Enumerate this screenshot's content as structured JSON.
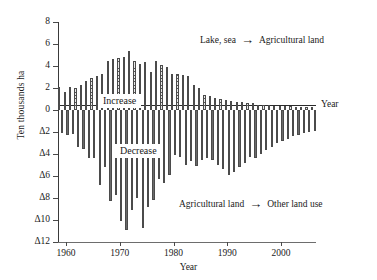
{
  "chart_data": {
    "type": "bar",
    "title": "",
    "xlabel": "Year",
    "ylabel": "Ten thousands  ha",
    "ylim": [
      -12,
      8
    ],
    "xlim": [
      1958.5,
      2006.5
    ],
    "grid": false,
    "legend_position": "none",
    "ytick_labels": [
      "8",
      "6",
      "4",
      "2",
      "0",
      "Δ2",
      "Δ4",
      "Δ6",
      "Δ8",
      "Δ10",
      "Δ12"
    ],
    "ytick_values": [
      8,
      6,
      4,
      2,
      0,
      -2,
      -4,
      -6,
      -8,
      -10,
      -12
    ],
    "xtick_labels": [
      "1960",
      "1970",
      "1980",
      "1990",
      "2000"
    ],
    "xtick_values": [
      1960,
      1970,
      1980,
      1990,
      2000
    ],
    "axis_right_label": "Year",
    "series": [
      {
        "name": "Lake, sea → Agricultural land",
        "direction": "increase",
        "pattern": "diagonal-crosshatch",
        "values": [
          2.1,
          1.6,
          2.1,
          2.0,
          2.3,
          2.6,
          2.9,
          3.1,
          3.3,
          4.5,
          4.6,
          4.7,
          4.8,
          5.4,
          4.5,
          4.2,
          4.4,
          3.5,
          4.5,
          4.1,
          3.9,
          3.3,
          3.3,
          3.2,
          3.1,
          2.3,
          2.0,
          1.4,
          1.3,
          1.1,
          1.0,
          0.9,
          0.8,
          0.7,
          0.7,
          0.6,
          0.6,
          0.5,
          0.5,
          0.5,
          0.4,
          0.4,
          0.4,
          0.4,
          0.3,
          0.3,
          0.3,
          0.3
        ]
      },
      {
        "name": "Agricultural land → Other land use",
        "direction": "decrease",
        "pattern": "vertical-lines",
        "values": [
          -2.1,
          -2.3,
          -2.2,
          -3.4,
          -3.5,
          -4.4,
          -4.4,
          -6.8,
          -5.2,
          -8.3,
          -7.7,
          -10.1,
          -10.9,
          -9.1,
          -8.0,
          -10.7,
          -8.8,
          -8.2,
          -6.3,
          -6.6,
          -5.9,
          -4.1,
          -4.3,
          -5.0,
          -4.6,
          -5.1,
          -4.5,
          -4.4,
          -4.5,
          -5.0,
          -5.4,
          -5.9,
          -5.6,
          -5.2,
          -4.8,
          -4.3,
          -4.4,
          -4.0,
          -3.6,
          -3.4,
          -3.0,
          -2.8,
          -2.6,
          -2.4,
          -2.3,
          -2.1,
          -2.0,
          -1.9
        ]
      }
    ],
    "x": [
      1959,
      1960,
      1961,
      1962,
      1963,
      1964,
      1965,
      1966,
      1967,
      1968,
      1969,
      1970,
      1971,
      1972,
      1973,
      1974,
      1975,
      1976,
      1977,
      1978,
      1979,
      1980,
      1981,
      1982,
      1983,
      1984,
      1985,
      1986,
      1987,
      1988,
      1989,
      1990,
      1991,
      1992,
      1993,
      1994,
      1995,
      1996,
      1997,
      1998,
      1999,
      2000,
      2001,
      2002,
      2003,
      2004,
      2005,
      2006
    ],
    "annotations": [
      {
        "id": "tag-increase",
        "text": "Increase"
      },
      {
        "id": "tag-decrease",
        "text": "Decrease"
      },
      {
        "id": "note-top",
        "left_text": "Lake, sea",
        "arrow": "→",
        "right_text": "Agricultural land"
      },
      {
        "id": "note-bottom",
        "left_text": "Agricultural land",
        "arrow": "→",
        "right_text": "Other land use"
      }
    ]
  }
}
